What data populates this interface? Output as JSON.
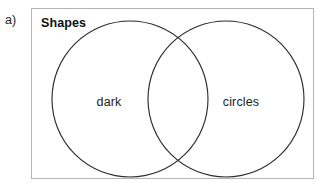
{
  "figure": {
    "part_label": "a)",
    "type": "venn-diagram",
    "set_count": 2
  },
  "diagram": {
    "title": "Shapes",
    "universe_label": "Shapes",
    "circles": [
      {
        "id": "left-circle",
        "label": "dark",
        "cx": 99,
        "cy": 91,
        "r": 78,
        "stroke": "#2b2b2b"
      },
      {
        "id": "right-circle",
        "label": "circles",
        "cx": 195,
        "cy": 91,
        "r": 78,
        "stroke": "#2b2b2b"
      }
    ],
    "regions": [
      {
        "id": "left-only",
        "label": "dark"
      },
      {
        "id": "right-only",
        "label": "circles"
      },
      {
        "id": "intersection",
        "label": ""
      }
    ],
    "box": {
      "stroke": "#b3b3b3",
      "fill": "#ffffff"
    }
  },
  "colors": {
    "background": "#ffffff",
    "box_border": "#b3b3b3",
    "circle_stroke": "#2b2b2b",
    "text": "#1b1b1b",
    "title_text": "#101010"
  }
}
